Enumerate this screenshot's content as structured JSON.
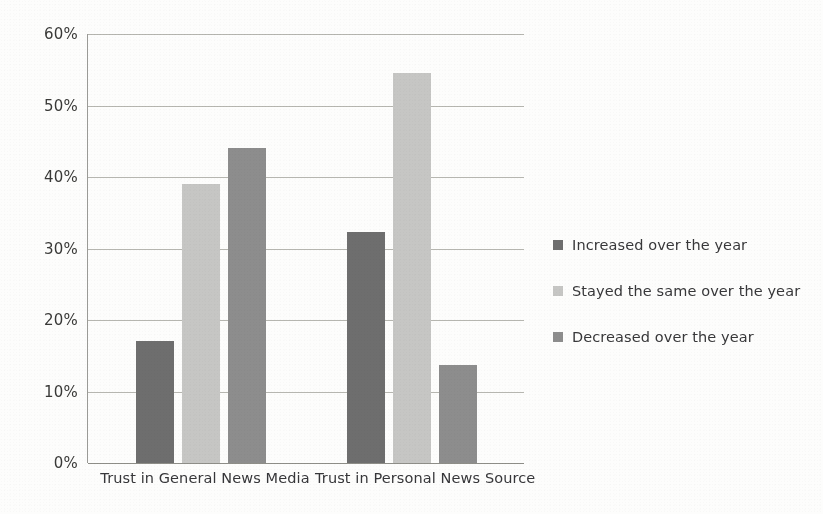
{
  "chart_data": {
    "type": "bar",
    "title": "",
    "subtitle": "",
    "xlabel": "",
    "ylabel": "",
    "categories": [
      "Trust in General News Media",
      "Trust in Personal News Source"
    ],
    "series": [
      {
        "name": "Increased over the year",
        "values": [
          17.0,
          32.3
        ],
        "color": "#6e6e6e"
      },
      {
        "name": "Stayed the same over the year",
        "values": [
          39.0,
          54.5
        ],
        "color": "#c6c6c4"
      },
      {
        "name": "Decreased over the year",
        "values": [
          44.0,
          13.7
        ],
        "color": "#8d8d8d"
      }
    ],
    "ylim": [
      0,
      60
    ],
    "yticks": [
      "0%",
      "10%",
      "20%",
      "30%",
      "40%",
      "50%",
      "60%"
    ],
    "ytick_values": [
      0,
      10,
      20,
      30,
      40,
      50,
      60
    ],
    "grid": true,
    "legend_position": "right",
    "value_format": "percent"
  },
  "legend": {
    "items": [
      {
        "label": "Increased over the year",
        "color": "#6e6e6e"
      },
      {
        "label": "Stayed the same over the year",
        "color": "#c6c6c4"
      },
      {
        "label": "Decreased over the year",
        "color": "#8d8d8d"
      }
    ]
  },
  "axis": {
    "y_labels": [
      "60%",
      "50%",
      "40%",
      "30%",
      "20%",
      "10%",
      "0%"
    ],
    "x_labels": [
      "Trust in General News Media",
      "Trust in Personal News Source"
    ]
  }
}
